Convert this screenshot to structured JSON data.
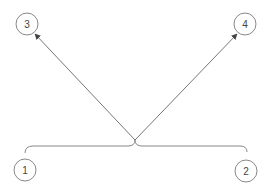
{
  "diagram": {
    "nodes": [
      {
        "id": "1",
        "label": "1",
        "cx": 25,
        "cy": 170
      },
      {
        "id": "2",
        "label": "2",
        "cx": 246,
        "cy": 171
      },
      {
        "id": "3",
        "label": "3",
        "cx": 27,
        "cy": 24
      },
      {
        "id": "4",
        "label": "4",
        "cx": 245,
        "cy": 24
      }
    ],
    "brace": {
      "from": "1",
      "to": "2",
      "tip": [
        135,
        140
      ]
    },
    "edges": [
      {
        "from": "brace",
        "to": "3"
      },
      {
        "from": "brace",
        "to": "4"
      }
    ],
    "colors": {
      "stroke": "#777777",
      "text": "#444444"
    }
  }
}
